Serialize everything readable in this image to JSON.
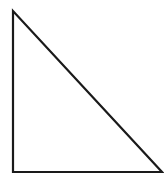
{
  "diagram": {
    "shape": "right-triangle",
    "stroke_color": "#1a1a1a",
    "fill_color": "#ffffff",
    "stroke_width": 2.2,
    "vertices": {
      "top": [
        13,
        11
      ],
      "bottom_left": [
        13,
        172
      ],
      "bottom_right": [
        162,
        172
      ]
    }
  }
}
